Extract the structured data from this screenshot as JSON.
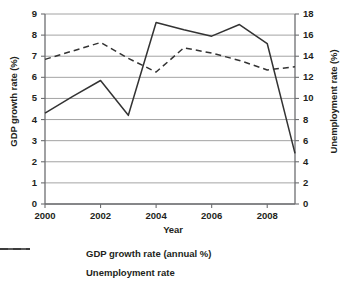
{
  "chart_data": {
    "type": "line",
    "title": "",
    "xlabel": "Year",
    "ylabel": "GDP growth rate (%)",
    "y2label": "Unemployment rate (%)",
    "x": [
      2000,
      2001,
      2002,
      2003,
      2004,
      2005,
      2006,
      2007,
      2008,
      2009
    ],
    "xlim": [
      2000,
      2009
    ],
    "xticks": [
      2000,
      2002,
      2004,
      2006,
      2008
    ],
    "xtick_labels": [
      "2000",
      "2002",
      "2004",
      "2006",
      "2008"
    ],
    "ylim": [
      0,
      9
    ],
    "yticks": [
      0,
      1,
      2,
      3,
      4,
      5,
      6,
      7,
      8,
      9
    ],
    "ytick_labels": [
      "0",
      "1",
      "2",
      "3",
      "4",
      "5",
      "6",
      "7",
      "8",
      "9"
    ],
    "y2lim": [
      0,
      18
    ],
    "y2ticks": [
      0,
      2,
      4,
      6,
      8,
      10,
      12,
      14,
      16,
      18
    ],
    "y2tick_labels": [
      "0",
      "2",
      "4",
      "6",
      "8",
      "10",
      "12",
      "14",
      "16",
      "18"
    ],
    "grid": true,
    "grid_axis": "y",
    "legend_position": "bottom",
    "series": [
      {
        "name": "GDP growth rate (annual %)",
        "axis": "left",
        "style": "solid",
        "color": "#333333",
        "values": [
          4.3,
          5.1,
          5.85,
          4.2,
          8.6,
          8.25,
          7.95,
          8.5,
          7.6,
          2.4
        ]
      },
      {
        "name": "Unemployment rate",
        "axis": "right",
        "style": "dashed",
        "color": "#333333",
        "values": [
          13.7,
          14.5,
          15.3,
          13.8,
          12.5,
          14.8,
          14.3,
          13.6,
          12.7,
          13.0
        ]
      }
    ]
  },
  "legend": {
    "items": [
      {
        "label": "GDP growth rate (annual %)",
        "style": "solid"
      },
      {
        "label": "Unemployment rate",
        "style": "dashed"
      }
    ]
  },
  "colors": {
    "axis": "#6d6e71",
    "grid": "#8c8c8c",
    "line": "#333333",
    "text": "#231f20",
    "background": "#ffffff"
  }
}
